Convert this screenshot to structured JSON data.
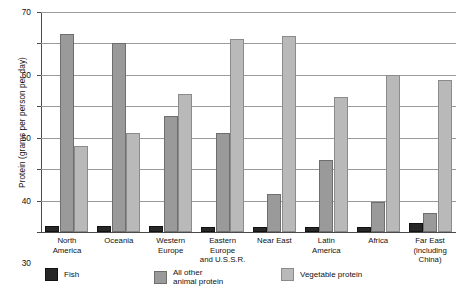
{
  "chart_data": {
    "type": "bar",
    "title": "",
    "xlabel": "",
    "ylabel": "Protein (grams per person per day)",
    "ylim": [
      0,
      70
    ],
    "yticks": [
      0,
      10,
      20,
      30,
      40,
      50,
      60,
      70
    ],
    "ytick_labels": [
      "0",
      "10",
      "20",
      "30",
      "40",
      "50",
      "60",
      "70"
    ],
    "grid": true,
    "legend_position": "bottom-left",
    "categories": [
      "North America",
      "Oceania",
      "Western Europe",
      "Eastern Europe and U.S.S.R.",
      "Near East",
      "Latin America",
      "Africa",
      "Far East (including China)"
    ],
    "category_lines": [
      [
        "North",
        "America"
      ],
      [
        "Oceania"
      ],
      [
        "Western",
        "Europe"
      ],
      [
        "Eastern",
        "Europe",
        "and U.S.S.R."
      ],
      [
        "Near East"
      ],
      [
        "Latin",
        "America"
      ],
      [
        "Africa"
      ],
      [
        "Far East",
        "(including",
        "China)"
      ]
    ],
    "series": [
      {
        "name": "Fish",
        "color": "#272727",
        "values": [
          2,
          2,
          2,
          1.5,
          1.5,
          1.5,
          1.5,
          3
        ]
      },
      {
        "name": "All other animal protein",
        "color": "#9a9a9a",
        "values": [
          63,
          60,
          37,
          31.5,
          12,
          23,
          9.5,
          6
        ]
      },
      {
        "name": "Vegetable protein",
        "color": "#b9b9b9",
        "values": [
          27.5,
          31.5,
          44,
          61.5,
          62.5,
          43,
          50,
          48.5
        ]
      }
    ],
    "legend": [
      {
        "label": "Fish",
        "swatch": "fish"
      },
      {
        "label": "All other\nanimal protein",
        "swatch": "animal"
      },
      {
        "label": "Vegetable protein",
        "swatch": "vegetable"
      }
    ]
  }
}
